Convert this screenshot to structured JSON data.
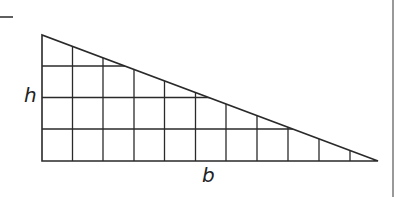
{
  "figure": {
    "type": "right-triangle-area-grid",
    "labels": {
      "height": "h",
      "base": "b"
    },
    "grid": {
      "columns": 11,
      "rows": 4
    },
    "colors": {
      "stroke": "#2a2a2a",
      "background": "#ffffff"
    }
  }
}
